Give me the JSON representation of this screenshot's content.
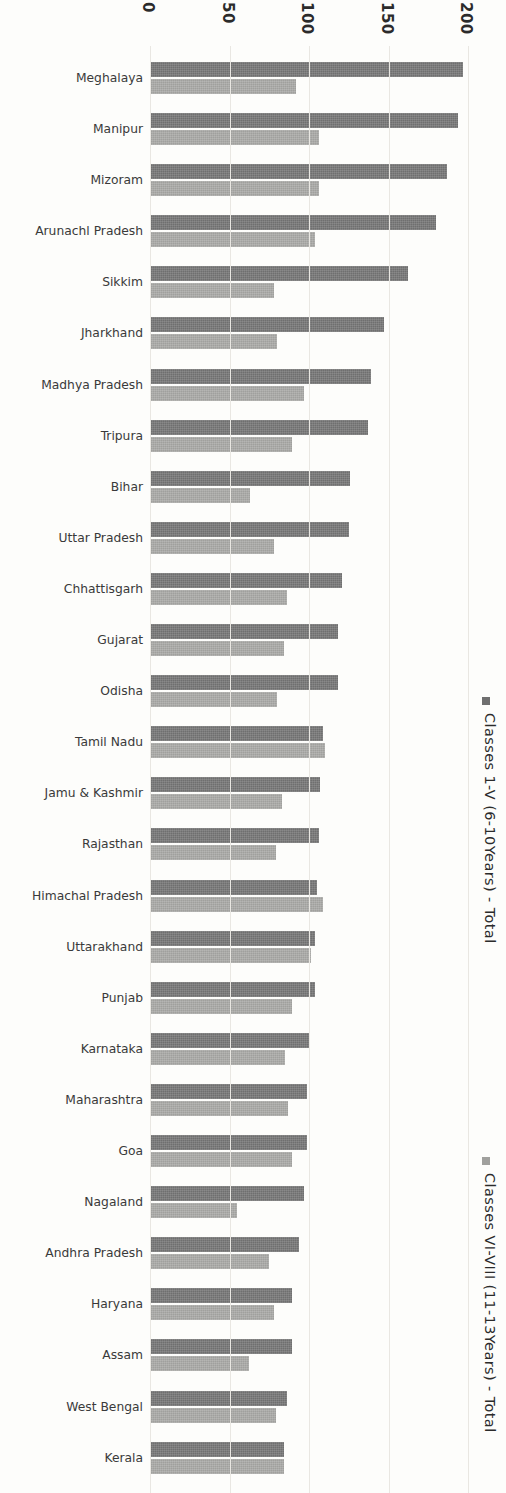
{
  "chart_data": {
    "type": "bar",
    "orientation": "horizontal",
    "title": "",
    "xlabel": "",
    "ylabel": "",
    "xlim": [
      0,
      200
    ],
    "xticks": [
      0,
      50,
      100,
      150,
      200
    ],
    "tick_labels": [
      "0",
      "50",
      "100",
      "150",
      "200"
    ],
    "grid": true,
    "grid_axis": "x",
    "legend_position": "right",
    "categories": [
      "Meghalaya",
      "Manipur",
      "Mizoram",
      "Arunachl Pradesh",
      "Sikkim",
      "Jharkhand",
      "Madhya Pradesh",
      "Tripura",
      "Bihar",
      "Uttar Pradesh",
      "Chhattisgarh",
      "Gujarat",
      "Odisha",
      "Tamil Nadu",
      "Jamu & Kashmir",
      "Rajasthan",
      "Himachal Pradesh",
      "Uttarakhand",
      "Punjab",
      "Karnataka",
      "Maharashtra",
      "Goa",
      "Nagaland",
      "Andhra Pradesh",
      "Haryana",
      "Assam",
      "West Bengal",
      "Kerala"
    ],
    "series": [
      {
        "name": "Classes 1-V (6-10Years) - Total",
        "color": "#6f6f6f",
        "values": [
          197,
          194,
          187,
          180,
          162,
          147,
          139,
          137,
          126,
          125,
          121,
          118,
          118,
          109,
          107,
          106,
          105,
          104,
          104,
          100,
          99,
          99,
          97,
          94,
          89,
          89,
          86,
          84
        ]
      },
      {
        "name": "Classes VI-VIII (11-13Years) - Total",
        "color": "#a0a09d",
        "values": [
          92,
          106,
          106,
          104,
          78,
          80,
          97,
          89,
          63,
          78,
          86,
          84,
          80,
          110,
          83,
          79,
          109,
          101,
          89,
          85,
          87,
          89,
          55,
          75,
          78,
          62,
          79,
          84
        ]
      }
    ]
  },
  "legend": [
    {
      "label": "Classes 1-V (6-10Years) - Total",
      "swatch_icon": "square-swatch-dark"
    },
    {
      "label": "Classes VI-VIII (11-13Years) - Total",
      "swatch_icon": "square-swatch-light"
    }
  ]
}
